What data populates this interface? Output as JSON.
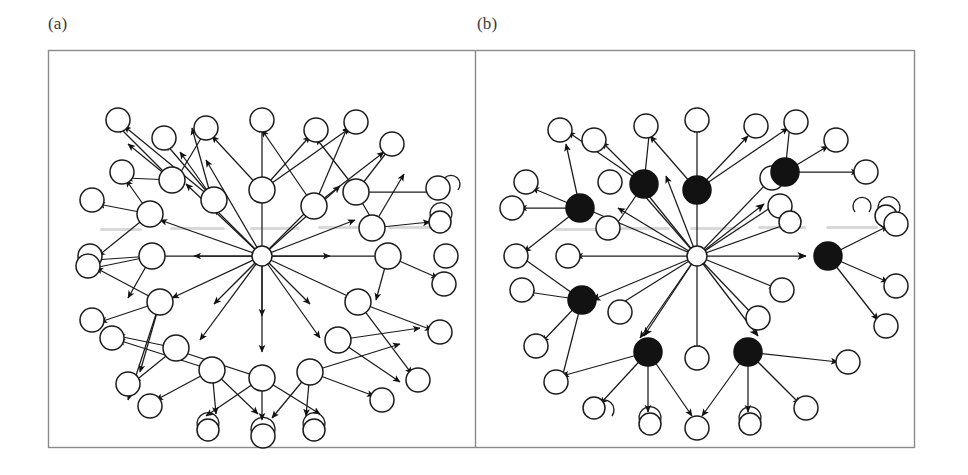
{
  "figure": {
    "type": "diagram",
    "panels": [
      {
        "id": "a",
        "label": "(a)",
        "caption": "",
        "node_count": 41,
        "filled_node_count": 0,
        "root": {
          "cx": 262,
          "cy": 256,
          "r": 9.5,
          "fill": "open"
        },
        "rings": {
          "inner_radius": 68,
          "outer_radius": 148
        }
      },
      {
        "id": "b",
        "label": "(b)",
        "caption": "",
        "node_count": 41,
        "filled_node_count": 8,
        "root": {
          "cx": 697,
          "cy": 256,
          "r": 9.5,
          "fill": "open"
        },
        "rings": {
          "inner_radius": 68,
          "outer_radius": 148
        }
      }
    ],
    "frame": {
      "x": 48,
      "y": 50,
      "width": 867,
      "height": 398,
      "divider_x": 475,
      "stroke_color": "#8a8a8a"
    },
    "colors": {
      "background": "#ffffff",
      "stroke": "#1b1b1b",
      "node_open_fill": "#ffffff",
      "node_filled_fill": "#121212",
      "frame": "#8a8a8a",
      "label_text": "#3a3a3a"
    },
    "graph": {
      "inner_nodes": 8,
      "outer_nodes_per_inner": 4,
      "self_loops": 5,
      "inner_angles_deg": [
        90,
        45,
        0,
        315,
        270,
        225,
        180,
        135
      ]
    }
  }
}
